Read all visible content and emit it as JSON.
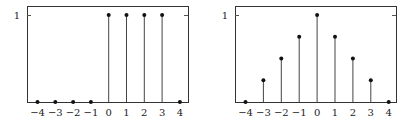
{
  "chart_data": [
    {
      "type": "stem",
      "title": "",
      "xlabel": "",
      "ylabel": "",
      "x": [
        -4,
        -3,
        -2,
        -1,
        0,
        1,
        2,
        3,
        4
      ],
      "values": [
        0,
        0,
        0,
        0,
        1,
        1,
        1,
        1,
        0
      ],
      "xtick_labels": [
        "−4",
        "−3",
        "−2",
        "−1",
        "0",
        "1",
        "2",
        "3",
        "4"
      ],
      "ytick_labels": [
        "1"
      ],
      "ylim": [
        0,
        1
      ],
      "grid": false,
      "legend": null
    },
    {
      "type": "stem",
      "title": "",
      "xlabel": "",
      "ylabel": "",
      "x": [
        -4,
        -3,
        -2,
        -1,
        0,
        1,
        2,
        3,
        4
      ],
      "values": [
        0,
        0.25,
        0.5,
        0.75,
        1,
        0.75,
        0.5,
        0.25,
        0
      ],
      "xtick_labels": [
        "−4",
        "−3",
        "−2",
        "−1",
        "0",
        "1",
        "2",
        "3",
        "4"
      ],
      "ytick_labels": [
        "1"
      ],
      "ylim": [
        0,
        1
      ],
      "grid": false,
      "legend": null
    }
  ],
  "colors": {
    "frame": "#333333",
    "stem": "#444444",
    "marker": "#111111"
  }
}
